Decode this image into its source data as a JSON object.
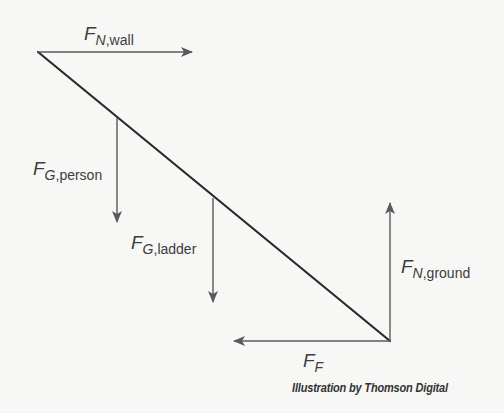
{
  "diagram": {
    "type": "free-body-diagram",
    "colors": {
      "ladder": "#2a2a2a",
      "arrows": "#5a5a5a",
      "text": "#3c3c3c",
      "background": "#f7f7f5"
    },
    "ladder": {
      "top": [
        38,
        52
      ],
      "bottom": [
        390,
        341
      ]
    },
    "forces": [
      {
        "id": "normal-wall",
        "symbol": "F",
        "subscript_italic": "N",
        "subscript_plain": ",wall",
        "direction": "right",
        "from": [
          38,
          52
        ],
        "to": [
          192,
          52
        ]
      },
      {
        "id": "gravity-person",
        "symbol": "F",
        "subscript_italic": "G",
        "subscript_plain": ",person",
        "direction": "down",
        "from": [
          117,
          118
        ],
        "to": [
          117,
          222
        ]
      },
      {
        "id": "gravity-ladder",
        "symbol": "F",
        "subscript_italic": "G",
        "subscript_plain": ",ladder",
        "direction": "down",
        "from": [
          213,
          198
        ],
        "to": [
          213,
          302
        ]
      },
      {
        "id": "normal-ground",
        "symbol": "F",
        "subscript_italic": "N",
        "subscript_plain": ",ground",
        "direction": "up",
        "from": [
          390,
          341
        ],
        "to": [
          390,
          203
        ]
      },
      {
        "id": "friction",
        "symbol": "F",
        "subscript_italic": "F",
        "subscript_plain": "",
        "direction": "left",
        "from": [
          390,
          341
        ],
        "to": [
          234,
          341
        ]
      }
    ],
    "labels": {
      "normal_wall": {
        "F": "F",
        "sub": "N",
        "rest": ",wall"
      },
      "gravity_person": {
        "F": "F",
        "sub": "G",
        "rest": ",person"
      },
      "gravity_ladder": {
        "F": "F",
        "sub": "G",
        "rest": ",ladder"
      },
      "normal_ground": {
        "F": "F",
        "sub": "N",
        "rest": ",ground"
      },
      "friction": {
        "F": "F",
        "sub": "F"
      }
    },
    "credit": "Illustration by Thomson Digital"
  }
}
